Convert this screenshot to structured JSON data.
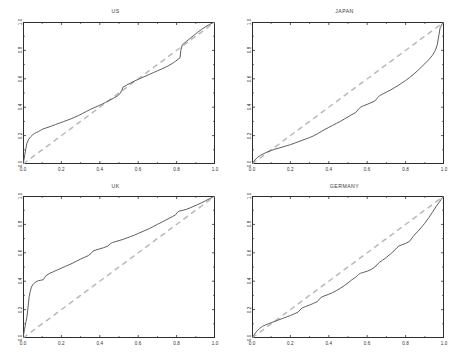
{
  "figure": {
    "background": "#ffffff",
    "curve_color": "#555555",
    "reference_color": "#b9b9b9",
    "axis_color": "#2e2e2e"
  },
  "chart_data": [
    {
      "type": "line",
      "title": "US",
      "xlabel": "",
      "ylabel": "",
      "xlim": [
        0,
        1
      ],
      "ylim": [
        0,
        1
      ],
      "grid": false,
      "legend": "none",
      "xticks": [
        0.0,
        0.2,
        0.4,
        0.6,
        0.8,
        1.0
      ],
      "xticklabels": [
        "0.0",
        "0.2",
        "0.4",
        "0.6",
        "0.8",
        "1.0"
      ],
      "yticks": [
        0.0,
        0.2,
        0.4,
        0.6,
        0.8,
        1.0
      ],
      "yticklabels": [
        "0.0",
        "0.2",
        "0.4",
        "0.6",
        "0.8",
        "1.0"
      ],
      "series": [
        {
          "name": "empirical",
          "style": "solid",
          "color": "#555555",
          "x": [
            0.0,
            0.005,
            0.01,
            0.015,
            0.02,
            0.03,
            0.04,
            0.05,
            0.06,
            0.07,
            0.08,
            0.09,
            0.1,
            0.115,
            0.13,
            0.15,
            0.17,
            0.19,
            0.21,
            0.23,
            0.25,
            0.27,
            0.29,
            0.31,
            0.33,
            0.35,
            0.37,
            0.39,
            0.41,
            0.43,
            0.45,
            0.47,
            0.49,
            0.505,
            0.515,
            0.52,
            0.54,
            0.56,
            0.58,
            0.6,
            0.62,
            0.64,
            0.66,
            0.68,
            0.7,
            0.72,
            0.74,
            0.76,
            0.78,
            0.795,
            0.81,
            0.818,
            0.822,
            0.83,
            0.85,
            0.87,
            0.89,
            0.91,
            0.93,
            0.95,
            0.97,
            0.985,
            1.0
          ],
          "y": [
            0.0,
            0.03,
            0.07,
            0.11,
            0.145,
            0.175,
            0.192,
            0.205,
            0.215,
            0.222,
            0.228,
            0.236,
            0.244,
            0.252,
            0.258,
            0.268,
            0.278,
            0.288,
            0.298,
            0.308,
            0.318,
            0.33,
            0.342,
            0.356,
            0.37,
            0.384,
            0.396,
            0.408,
            0.42,
            0.434,
            0.448,
            0.462,
            0.478,
            0.495,
            0.52,
            0.54,
            0.556,
            0.57,
            0.584,
            0.596,
            0.608,
            0.62,
            0.632,
            0.644,
            0.656,
            0.668,
            0.68,
            0.694,
            0.71,
            0.724,
            0.74,
            0.748,
            0.8,
            0.84,
            0.862,
            0.884,
            0.906,
            0.928,
            0.948,
            0.966,
            0.982,
            0.992,
            1.0
          ]
        },
        {
          "name": "reference-diagonal",
          "style": "dashed",
          "color": "#b9b9b9",
          "x": [
            0,
            1
          ],
          "y": [
            0,
            1
          ]
        }
      ]
    },
    {
      "type": "line",
      "title": "JAPAN",
      "xlabel": "",
      "ylabel": "",
      "xlim": [
        0,
        1
      ],
      "ylim": [
        0,
        1
      ],
      "grid": false,
      "legend": "none",
      "xticks": [
        0.0,
        0.2,
        0.4,
        0.6,
        0.8,
        1.0
      ],
      "xticklabels": [
        "0.0",
        "0.2",
        "0.4",
        "0.6",
        "0.8",
        "1.0"
      ],
      "yticks": [
        0.0,
        0.2,
        0.4,
        0.6,
        0.8,
        1.0
      ],
      "yticklabels": [
        "0.0",
        "0.2",
        "0.4",
        "0.6",
        "0.8",
        "1.0"
      ],
      "series": [
        {
          "name": "empirical",
          "style": "solid",
          "color": "#555555",
          "x": [
            0.0,
            0.01,
            0.02,
            0.03,
            0.045,
            0.06,
            0.08,
            0.1,
            0.12,
            0.14,
            0.16,
            0.18,
            0.2,
            0.22,
            0.24,
            0.26,
            0.28,
            0.3,
            0.32,
            0.34,
            0.36,
            0.38,
            0.4,
            0.42,
            0.44,
            0.46,
            0.48,
            0.5,
            0.52,
            0.54,
            0.555,
            0.565,
            0.58,
            0.6,
            0.62,
            0.64,
            0.655,
            0.665,
            0.68,
            0.7,
            0.72,
            0.74,
            0.76,
            0.78,
            0.8,
            0.82,
            0.84,
            0.86,
            0.88,
            0.9,
            0.92,
            0.94,
            0.955,
            0.965,
            0.97,
            0.98,
            0.99,
            1.0
          ],
          "y": [
            0.0,
            0.02,
            0.035,
            0.048,
            0.062,
            0.072,
            0.085,
            0.095,
            0.105,
            0.112,
            0.12,
            0.128,
            0.136,
            0.146,
            0.156,
            0.166,
            0.176,
            0.186,
            0.198,
            0.212,
            0.228,
            0.244,
            0.258,
            0.272,
            0.286,
            0.3,
            0.316,
            0.332,
            0.348,
            0.362,
            0.386,
            0.4,
            0.41,
            0.42,
            0.432,
            0.444,
            0.468,
            0.482,
            0.492,
            0.506,
            0.52,
            0.536,
            0.552,
            0.57,
            0.588,
            0.608,
            0.63,
            0.654,
            0.68,
            0.706,
            0.734,
            0.766,
            0.8,
            0.84,
            0.88,
            0.96,
            0.985,
            1.0
          ]
        },
        {
          "name": "reference-diagonal",
          "style": "dashed",
          "color": "#b9b9b9",
          "x": [
            0,
            1
          ],
          "y": [
            0,
            1
          ]
        }
      ]
    },
    {
      "type": "line",
      "title": "UK",
      "xlabel": "",
      "ylabel": "",
      "xlim": [
        0,
        1
      ],
      "ylim": [
        0,
        1
      ],
      "grid": false,
      "legend": "none",
      "xticks": [
        0.0,
        0.2,
        0.4,
        0.6,
        0.8,
        1.0
      ],
      "xticklabels": [
        "0.0",
        "0.2",
        "0.4",
        "0.6",
        "0.8",
        "1.0"
      ],
      "yticks": [
        0.0,
        0.2,
        0.4,
        0.6,
        0.8,
        1.0
      ],
      "yticklabels": [
        "0.0",
        "0.2",
        "0.4",
        "0.6",
        "0.8",
        "1.0"
      ],
      "series": [
        {
          "name": "empirical",
          "style": "solid",
          "color": "#555555",
          "x": [
            0.0,
            0.004,
            0.008,
            0.012,
            0.016,
            0.02,
            0.024,
            0.028,
            0.032,
            0.038,
            0.044,
            0.05,
            0.058,
            0.066,
            0.074,
            0.082,
            0.09,
            0.098,
            0.105,
            0.112,
            0.12,
            0.14,
            0.16,
            0.18,
            0.2,
            0.22,
            0.24,
            0.26,
            0.28,
            0.3,
            0.32,
            0.34,
            0.355,
            0.365,
            0.38,
            0.4,
            0.42,
            0.44,
            0.455,
            0.465,
            0.48,
            0.5,
            0.52,
            0.54,
            0.56,
            0.58,
            0.6,
            0.62,
            0.64,
            0.66,
            0.68,
            0.7,
            0.72,
            0.74,
            0.76,
            0.78,
            0.795,
            0.805,
            0.815,
            0.83,
            0.85,
            0.87,
            0.89,
            0.91,
            0.93,
            0.95,
            0.97,
            0.985,
            1.0
          ],
          "y": [
            0.0,
            0.03,
            0.06,
            0.09,
            0.118,
            0.145,
            0.19,
            0.24,
            0.29,
            0.33,
            0.358,
            0.374,
            0.386,
            0.394,
            0.4,
            0.404,
            0.406,
            0.408,
            0.41,
            0.424,
            0.44,
            0.456,
            0.468,
            0.48,
            0.492,
            0.504,
            0.516,
            0.528,
            0.542,
            0.556,
            0.568,
            0.58,
            0.596,
            0.612,
            0.62,
            0.628,
            0.636,
            0.646,
            0.664,
            0.672,
            0.678,
            0.686,
            0.694,
            0.704,
            0.714,
            0.724,
            0.736,
            0.748,
            0.76,
            0.772,
            0.786,
            0.8,
            0.814,
            0.828,
            0.842,
            0.856,
            0.868,
            0.886,
            0.894,
            0.898,
            0.906,
            0.916,
            0.928,
            0.94,
            0.952,
            0.966,
            0.98,
            0.99,
            1.0
          ]
        },
        {
          "name": "reference-diagonal",
          "style": "dashed",
          "color": "#b9b9b9",
          "x": [
            0,
            1
          ],
          "y": [
            0,
            1
          ]
        }
      ]
    },
    {
      "type": "line",
      "title": "GERMANY",
      "xlabel": "",
      "ylabel": "",
      "xlim": [
        0,
        1
      ],
      "ylim": [
        0,
        1
      ],
      "grid": false,
      "legend": "none",
      "xticks": [
        0.0,
        0.2,
        0.4,
        0.6,
        0.8,
        1.0
      ],
      "xticklabels": [
        "0.0",
        "0.2",
        "0.4",
        "0.6",
        "0.8",
        "1.0"
      ],
      "yticks": [
        0.0,
        0.2,
        0.4,
        0.6,
        0.8,
        1.0
      ],
      "yticklabels": [
        "0.0",
        "0.2",
        "0.4",
        "0.6",
        "0.8",
        "1.0"
      ],
      "series": [
        {
          "name": "empirical",
          "style": "solid",
          "color": "#555555",
          "x": [
            0.0,
            0.01,
            0.02,
            0.03,
            0.04,
            0.055,
            0.07,
            0.085,
            0.1,
            0.12,
            0.14,
            0.16,
            0.18,
            0.2,
            0.22,
            0.24,
            0.255,
            0.265,
            0.28,
            0.3,
            0.32,
            0.34,
            0.355,
            0.365,
            0.38,
            0.4,
            0.42,
            0.44,
            0.46,
            0.48,
            0.5,
            0.52,
            0.54,
            0.555,
            0.565,
            0.58,
            0.6,
            0.62,
            0.64,
            0.655,
            0.665,
            0.68,
            0.7,
            0.72,
            0.74,
            0.755,
            0.765,
            0.78,
            0.8,
            0.82,
            0.84,
            0.855,
            0.865,
            0.88,
            0.9,
            0.92,
            0.94,
            0.96,
            0.975,
            0.985,
            1.0
          ],
          "y": [
            0.0,
            0.02,
            0.04,
            0.055,
            0.068,
            0.082,
            0.092,
            0.1,
            0.108,
            0.118,
            0.128,
            0.138,
            0.148,
            0.158,
            0.17,
            0.182,
            0.204,
            0.214,
            0.222,
            0.232,
            0.244,
            0.256,
            0.28,
            0.29,
            0.298,
            0.308,
            0.32,
            0.334,
            0.35,
            0.368,
            0.388,
            0.41,
            0.428,
            0.448,
            0.456,
            0.462,
            0.47,
            0.482,
            0.5,
            0.522,
            0.534,
            0.548,
            0.568,
            0.59,
            0.614,
            0.636,
            0.648,
            0.656,
            0.666,
            0.68,
            0.716,
            0.74,
            0.752,
            0.776,
            0.808,
            0.846,
            0.886,
            0.928,
            0.956,
            0.976,
            1.0
          ]
        },
        {
          "name": "reference-diagonal",
          "style": "dashed",
          "color": "#b9b9b9",
          "x": [
            0,
            1
          ],
          "y": [
            0,
            1
          ]
        }
      ]
    }
  ]
}
